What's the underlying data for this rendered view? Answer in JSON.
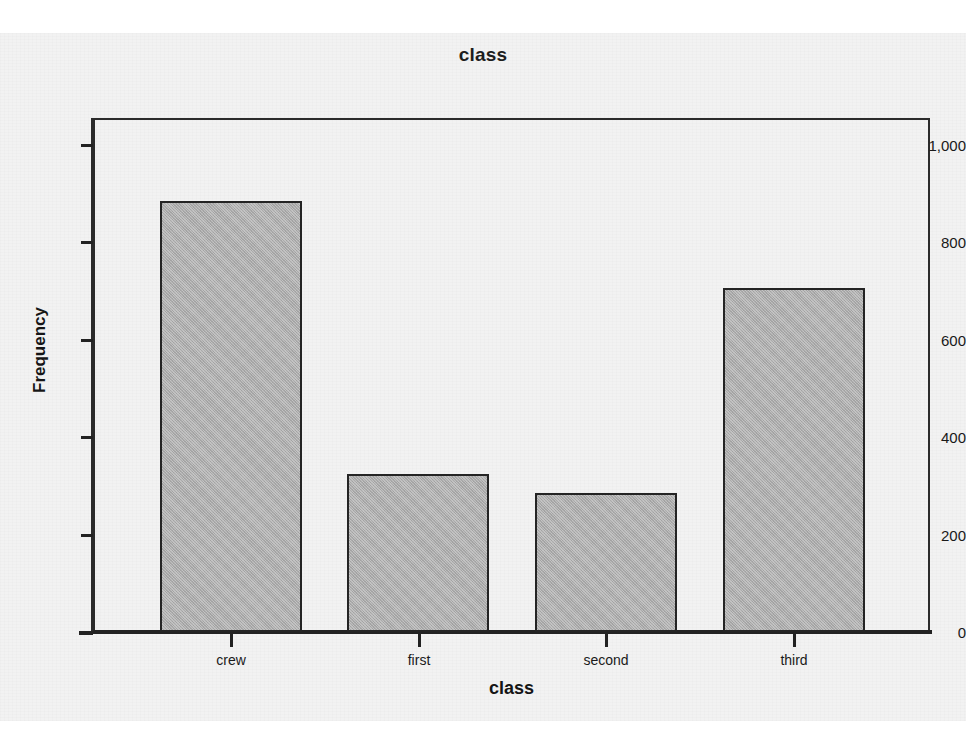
{
  "chart_data": {
    "type": "bar",
    "title": "class",
    "xlabel": "class",
    "ylabel": "Frequency",
    "categories": [
      "crew",
      "first",
      "second",
      "third"
    ],
    "values": [
      885,
      325,
      285,
      706
    ],
    "ylim": [
      0,
      1060
    ],
    "yticks": [
      0,
      200,
      400,
      600,
      800,
      1000
    ],
    "ytick_labels": [
      "0",
      "200",
      "400",
      "600",
      "800",
      "1,000"
    ],
    "grid": false,
    "legend": false,
    "bar_fill_color": "#ababab",
    "bar_border_color": "#242424",
    "plot_background_color": "#f2f2f2",
    "axis_color": "#2b2b2b"
  },
  "axis": {
    "y_title": "Frequency",
    "x_title": "class",
    "tick_0": "0",
    "tick_200": "200",
    "tick_400": "400",
    "tick_600": "600",
    "tick_800": "800",
    "tick_1000": "1,000"
  },
  "categories": {
    "c0": "crew",
    "c1": "first",
    "c2": "second",
    "c3": "third"
  },
  "header": {
    "title": "class"
  }
}
